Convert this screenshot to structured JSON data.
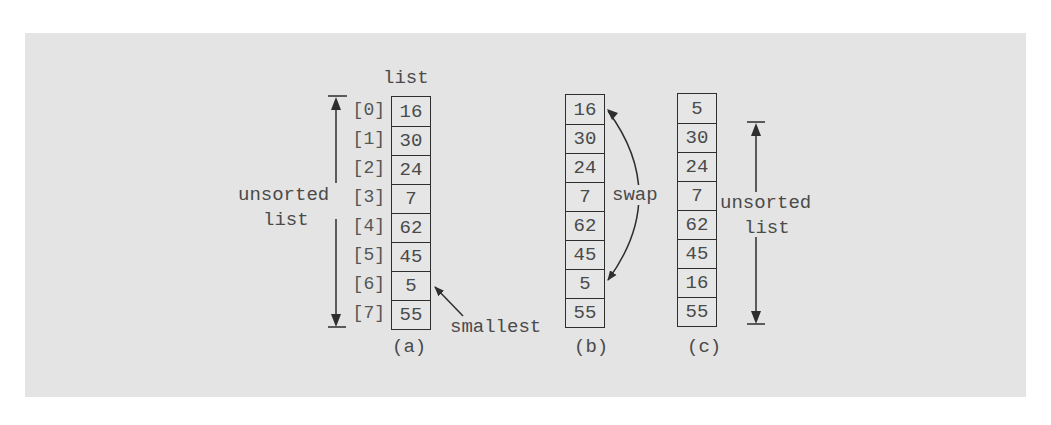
{
  "figure": {
    "header_label": "list",
    "indices": [
      "[0]",
      "[1]",
      "[2]",
      "[3]",
      "[4]",
      "[5]",
      "[6]",
      "[7]"
    ],
    "columns": [
      {
        "id": "a",
        "caption": "(a)",
        "values": [
          "16",
          "30",
          "24",
          "7",
          "62",
          "45",
          "5",
          "55"
        ]
      },
      {
        "id": "b",
        "caption": "(b)",
        "values": [
          "16",
          "30",
          "24",
          "7",
          "62",
          "45",
          "5",
          "55"
        ]
      },
      {
        "id": "c",
        "caption": "(c)",
        "values": [
          "5",
          "30",
          "24",
          "7",
          "62",
          "45",
          "16",
          "55"
        ]
      }
    ],
    "annotations": {
      "left_range_label": {
        "line1": "unsorted",
        "line2": "list"
      },
      "smallest_label": "smallest",
      "swap_label": "swap",
      "right_range_label": {
        "line1": "unsorted",
        "line2": "list"
      }
    },
    "colors": {
      "panel_background": "#e4e4e4",
      "stroke": "#2e2e2e",
      "text": "#4a4a4a"
    }
  }
}
